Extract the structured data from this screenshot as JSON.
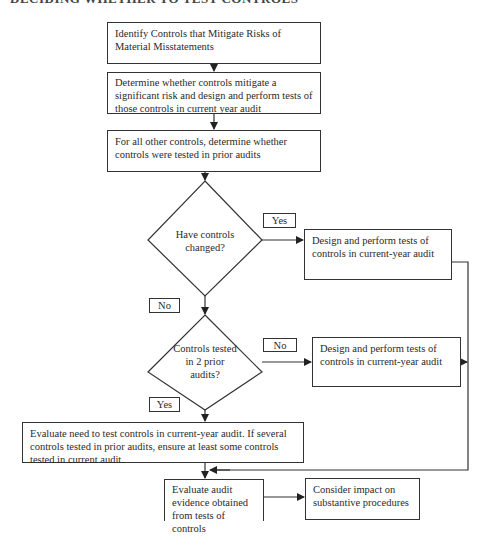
{
  "heading": "DECIDING WHETHER TO TEST CONTROLS",
  "nodes": {
    "identify": "Identify Controls that Mitigate Risks of Material Misstatements",
    "determine_significant": "Determine whether controls mitigate a significant risk and design and perform tests of those controls in current year audit",
    "other_controls": "For all other controls, determine whether controls were tested in prior audits",
    "decision_changed": "Have controls changed?",
    "design_perform_1": "Design and perform tests of controls in current-year audit",
    "decision_tested": "Controls tested in 2 prior audits?",
    "design_perform_2": "Design and perform tests of controls in current-year audit",
    "evaluate_need": "Evaluate need to test controls in current-year audit. If several controls tested in prior audits, ensure at least some controls tested in current audit",
    "evaluate_evidence": "Evaluate audit evidence obtained from tests of controls",
    "consider_impact": "Consider impact on substantive procedures"
  },
  "edge_labels": {
    "changed_yes": "Yes",
    "changed_no": "No",
    "tested_no": "No",
    "tested_yes": "Yes"
  },
  "colors": {
    "line": "#333333",
    "background": "#ffffff"
  }
}
